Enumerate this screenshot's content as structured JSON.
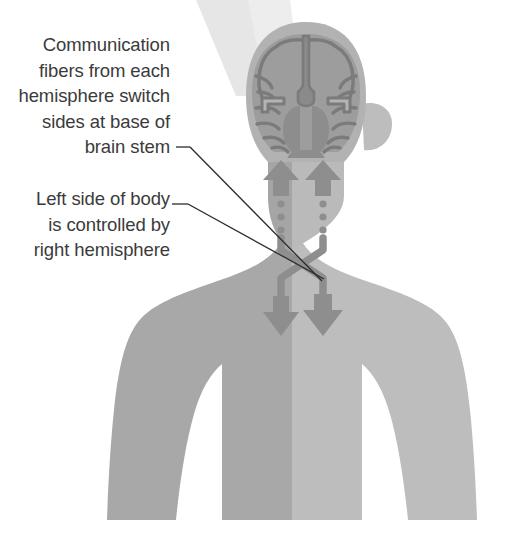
{
  "figure": {
    "width": 508,
    "height": 542,
    "background_color": "#ffffff"
  },
  "annotations": [
    {
      "id": "brainstem-crossing",
      "name": "callout-brainstem",
      "text": "Communication\nfibers from each\nhemisphere switch\nsides at base of\nbrain stem",
      "lines": [
        "Communication",
        "fibers from each",
        "hemisphere switch",
        "sides at base of",
        "brain stem"
      ],
      "align": "right",
      "text_color": "#3b3b3b",
      "leader_line": {
        "dash_x1": 176,
        "dash_y1": 147,
        "dash_x2": 190,
        "dash_y2": 147,
        "x1": 190,
        "y1": 147,
        "x2": 322,
        "y2": 281,
        "color": "#2c2c2c",
        "width": 1.3
      }
    },
    {
      "id": "left-side-control",
      "name": "callout-leftside",
      "text": "Left side of body\nis controlled by\nright hemisphere",
      "lines": [
        "Left side of body",
        "is controlled by",
        "right hemisphere"
      ],
      "align": "right",
      "text_color": "#3b3b3b",
      "leader_line": {
        "dash_x1": 172,
        "dash_y1": 204,
        "dash_x2": 188,
        "dash_y2": 204,
        "x1": 188,
        "y1": 204,
        "x2": 324,
        "y2": 279,
        "color": "#2c2c2c",
        "width": 1.3
      }
    }
  ],
  "colors": {
    "body_left_half": "#a8a8a8",
    "body_right_half": "#bcbcbc",
    "head_skull": "#b0b0b0",
    "brain_cortex": "#9a9a9a",
    "brain_outline": "#7d7d7d",
    "brain_deep": "#8a8a8a",
    "arrow": "#8e8e8e",
    "arrow_dark": "#7f7f7f",
    "light_beam": "#e4e4e4",
    "background": "#ffffff",
    "text": "#3b3b3b",
    "leader_line": "#2c2c2c"
  },
  "anatomy": {
    "parts": [
      {
        "name": "light-beam",
        "label": "Light beam wedge",
        "interactable": false
      },
      {
        "name": "torso",
        "label": "Torso and shoulders",
        "interactable": false
      },
      {
        "name": "body-left-half",
        "label": "Left half of body (darker)",
        "interactable": false
      },
      {
        "name": "body-right-half",
        "label": "Right half of body (lighter)",
        "interactable": false
      },
      {
        "name": "neck",
        "label": "Neck",
        "interactable": false
      },
      {
        "name": "head",
        "label": "Head",
        "interactable": false
      },
      {
        "name": "ear-right",
        "label": "Right ear",
        "interactable": false
      },
      {
        "name": "brain-coronal-section",
        "label": "Coronal brain section",
        "interactable": false
      },
      {
        "name": "cerebral-hemisphere-left",
        "label": "Left cerebral hemisphere",
        "interactable": false
      },
      {
        "name": "cerebral-hemisphere-right",
        "label": "Right cerebral hemisphere",
        "interactable": false
      },
      {
        "name": "longitudinal-fissure",
        "label": "Longitudinal fissure",
        "interactable": false
      },
      {
        "name": "lateral-ventricles",
        "label": "Lateral ventricles",
        "interactable": false
      },
      {
        "name": "basal-ganglia",
        "label": "Basal ganglia / thalamus",
        "interactable": false
      },
      {
        "name": "brain-stem",
        "label": "Brain stem",
        "interactable": false
      }
    ],
    "pathways": [
      {
        "name": "ascending-arrow-left",
        "label": "Ascending arrow into left hemisphere",
        "direction": "up",
        "side": "viewer-left"
      },
      {
        "name": "ascending-arrow-right",
        "label": "Ascending arrow into right hemisphere",
        "direction": "up",
        "side": "viewer-right"
      },
      {
        "name": "dotted-tract-left",
        "label": "Dotted fiber tract, left",
        "dot_count": 3
      },
      {
        "name": "dotted-tract-right",
        "label": "Dotted fiber tract, right",
        "dot_count": 3
      },
      {
        "name": "decussation-crossing",
        "label": "Fiber crossing (decussation) at base of brain stem"
      },
      {
        "name": "descending-arrow-left",
        "label": "Descending arrow, left side of body",
        "direction": "down"
      },
      {
        "name": "descending-arrow-right",
        "label": "Descending arrow, right side of body",
        "direction": "down"
      }
    ]
  }
}
